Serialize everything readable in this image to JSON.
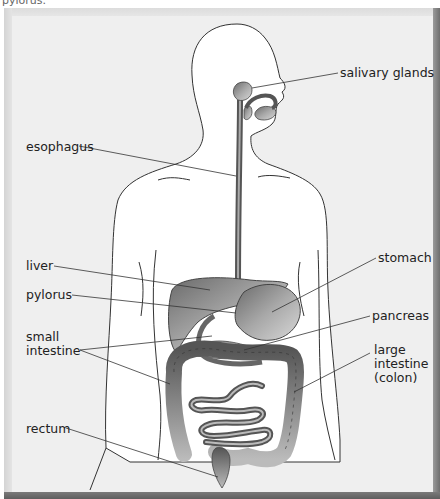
{
  "caption_top": "pylorus.",
  "labels": {
    "salivary_glands": "salivary glands",
    "esophagus": "esophagus",
    "liver": "liver",
    "pylorus": "pylorus",
    "small_intestine_1": "small",
    "small_intestine_2": "intestine",
    "stomach": "stomach",
    "pancreas": "pancreas",
    "large_intestine_1": "large",
    "large_intestine_2": "intestine",
    "large_intestine_3": "(colon)",
    "rectum": "rectum"
  },
  "colors": {
    "background": "#efefef",
    "body_fill": "#ffffff",
    "outline": "#333333",
    "organ_dark": "#5a5a5a",
    "organ_mid": "#8a8a8a",
    "organ_light": "#c8c8c8"
  }
}
